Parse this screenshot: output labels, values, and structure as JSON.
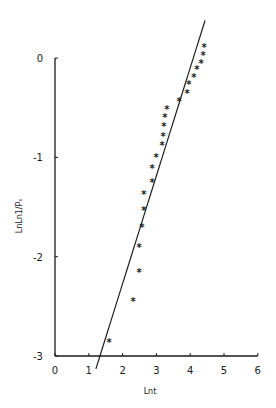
{
  "chart_data": {
    "type": "scatter",
    "title": "",
    "xlabel": "Lnt",
    "ylabel": "LnLn1/Pₛ",
    "xlim": [
      0,
      6
    ],
    "ylim": [
      -3,
      0
    ],
    "x_ticks": [
      0,
      1,
      2,
      3,
      4,
      5,
      6
    ],
    "y_ticks": [
      0,
      -1,
      -2,
      -3
    ],
    "grid": false,
    "legend": null,
    "series": [
      {
        "name": "observed",
        "marker": "*",
        "points": [
          {
            "x": 4.41,
            "y": 0.11
          },
          {
            "x": 4.38,
            "y": 0.03
          },
          {
            "x": 4.32,
            "y": -0.05
          },
          {
            "x": 4.2,
            "y": -0.11
          },
          {
            "x": 4.11,
            "y": -0.19
          },
          {
            "x": 3.96,
            "y": -0.26
          },
          {
            "x": 3.91,
            "y": -0.35
          },
          {
            "x": 3.67,
            "y": -0.43
          },
          {
            "x": 3.31,
            "y": -0.51
          },
          {
            "x": 3.25,
            "y": -0.59
          },
          {
            "x": 3.22,
            "y": -0.68
          },
          {
            "x": 3.2,
            "y": -0.78
          },
          {
            "x": 3.17,
            "y": -0.88
          },
          {
            "x": 2.99,
            "y": -1.0
          },
          {
            "x": 2.87,
            "y": -1.11
          },
          {
            "x": 2.87,
            "y": -1.25
          },
          {
            "x": 2.63,
            "y": -1.37
          },
          {
            "x": 2.63,
            "y": -1.53
          },
          {
            "x": 2.57,
            "y": -1.7
          },
          {
            "x": 2.49,
            "y": -1.9
          },
          {
            "x": 2.49,
            "y": -2.15
          },
          {
            "x": 2.31,
            "y": -2.45
          },
          {
            "x": 1.6,
            "y": -2.86
          }
        ]
      },
      {
        "name": "fitted line",
        "type": "line",
        "points": [
          {
            "x": 1.21,
            "y": -3.13
          },
          {
            "x": 4.44,
            "y": 0.38
          }
        ]
      }
    ]
  },
  "layout": {
    "plot_left_px": 55,
    "plot_bottom_px": 356,
    "px_per_x": 33.8,
    "px_per_y": 99.3
  }
}
